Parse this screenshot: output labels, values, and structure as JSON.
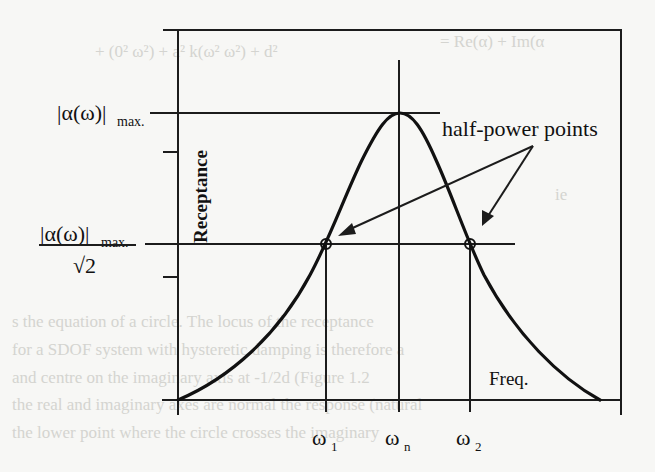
{
  "diagram": {
    "y_axis_label": "Receptance",
    "x_axis_label": "Freq.",
    "annotation": "half-power points",
    "max_label": {
      "main": "|α(ω)|",
      "subscript": "max."
    },
    "half_power_label": {
      "numerator_main": "|α(ω)|",
      "numerator_subscript": "max.",
      "denominator": "√2"
    },
    "x_ticks": [
      {
        "symbol": "ω",
        "subscript": "1"
      },
      {
        "symbol": "ω",
        "subscript": "n"
      },
      {
        "symbol": "ω",
        "subscript": "2"
      }
    ],
    "colors": {
      "ink": "#111111",
      "paper": "#f7f7f5"
    }
  }
}
